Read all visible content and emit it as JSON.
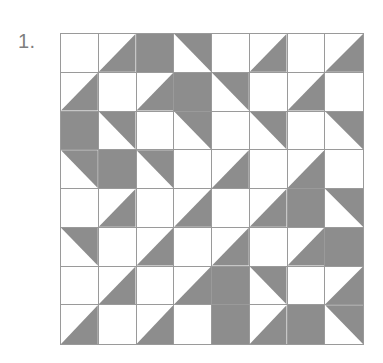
{
  "page": {
    "background_color": "#ffffff",
    "item_number": "1.",
    "ink_color": "#8d8d8d",
    "line_color": "#9a9a9a"
  },
  "figure": {
    "name": "shaded-square-grid-puzzle",
    "rows": 8,
    "columns": 8,
    "legend": {
      "none": "white square",
      "full": "fully shaded square",
      "tr": "shaded upper-right triangle",
      "bl": "shaded lower-left triangle",
      "tl": "shaded upper-left triangle",
      "br": "shaded lower-right triangle"
    },
    "cells": [
      [
        "none",
        "br",
        "full",
        "tr",
        "none",
        "br",
        "none",
        "br"
      ],
      [
        "br",
        "none",
        "br",
        "full",
        "tr",
        "none",
        "br",
        "none"
      ],
      [
        "full",
        "tr",
        "none",
        "tr",
        "none",
        "tr",
        "none",
        "tr"
      ],
      [
        "tr",
        "full",
        "tr",
        "none",
        "br",
        "none",
        "br",
        "none"
      ],
      [
        "none",
        "br",
        "none",
        "br",
        "none",
        "br",
        "full",
        "tr"
      ],
      [
        "tr",
        "none",
        "br",
        "none",
        "br",
        "none",
        "br",
        "full"
      ],
      [
        "none",
        "br",
        "none",
        "br",
        "full",
        "tr",
        "none",
        "br"
      ],
      [
        "br",
        "none",
        "br",
        "none",
        "full",
        "br",
        "full",
        "tr"
      ]
    ]
  }
}
